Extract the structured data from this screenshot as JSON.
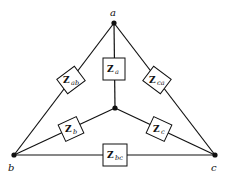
{
  "diagram": {
    "type": "circuit",
    "nodes": {
      "a": {
        "label": "a",
        "x": 114,
        "y": 23
      },
      "b": {
        "label": "b",
        "x": 14,
        "y": 155
      },
      "c": {
        "label": "c",
        "x": 215,
        "y": 155
      },
      "n": {
        "label": "",
        "x": 115,
        "y": 108
      }
    },
    "impedances": {
      "Za": {
        "main": "Z",
        "sub": "a",
        "between": [
          "a",
          "n"
        ]
      },
      "Zb": {
        "main": "Z",
        "sub": "b",
        "between": [
          "b",
          "n"
        ]
      },
      "Zc": {
        "main": "Z",
        "sub": "c",
        "between": [
          "c",
          "n"
        ]
      },
      "Zab": {
        "main": "Z",
        "sub": "ab",
        "between": [
          "a",
          "b"
        ]
      },
      "Zbc": {
        "main": "Z",
        "sub": "bc",
        "between": [
          "b",
          "c"
        ]
      },
      "Zca": {
        "main": "Z",
        "sub": "ca",
        "between": [
          "c",
          "a"
        ]
      }
    },
    "colors": {
      "line": "#111111",
      "background": "#ffffff"
    }
  }
}
